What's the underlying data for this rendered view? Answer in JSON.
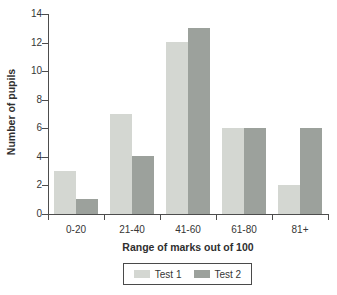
{
  "chart_data": {
    "type": "bar",
    "title": "",
    "categories": [
      "0-20",
      "21-40",
      "41-60",
      "61-80",
      "81+"
    ],
    "series": [
      {
        "name": "Test 1",
        "color": "#d4d7d2",
        "values": [
          3,
          7,
          12,
          6,
          2
        ]
      },
      {
        "name": "Test 2",
        "color": "#9ca19c",
        "values": [
          1,
          4,
          13,
          6,
          6
        ]
      }
    ],
    "xlabel": "Range of marks out of 100",
    "ylabel": "Number of pupils",
    "ylim": [
      0,
      14
    ],
    "yticks": [
      0,
      2,
      4,
      6,
      8,
      10,
      12,
      14
    ],
    "grid": false,
    "legend_position": "bottom",
    "axis_color": "#4d4d4d",
    "text_color": "#363636"
  }
}
